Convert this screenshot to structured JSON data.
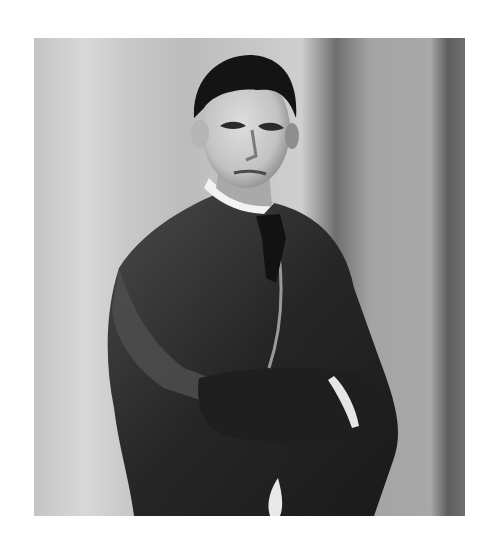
{
  "image": {
    "description": "Black-and-white vintage studio portrait of a young man with short dark swept-back hair, wearing a dark tweed three-piece suit, white high collar and dark tie, arms crossed, against a vertically banded grey background",
    "style": "grayscale photograph",
    "colors": {
      "page_background": "#ffffff",
      "background_light": "#d6d6d6",
      "background_mid": "#a8a8a8",
      "background_dark": "#6e6e6e",
      "suit": "#2a2a2a",
      "suit_highlight": "#555555",
      "hair": "#141414",
      "skin": "#cfcfcf",
      "skin_shadow": "#8f8f8f",
      "collar": "#f2f2f2"
    }
  }
}
